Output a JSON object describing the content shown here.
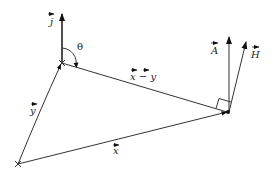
{
  "diagram": {
    "type": "vector-geometry",
    "points": {
      "top_vertex": [
        62,
        63
      ],
      "right_vertex": [
        228,
        112
      ],
      "bottom_left_vertex": [
        18,
        164
      ],
      "j_tip": [
        62,
        12
      ],
      "A_tip": [
        229,
        35
      ],
      "H_tip": [
        246,
        40
      ]
    },
    "labels": {
      "j": "j",
      "theta": "θ",
      "x_minus_y": "x − y",
      "A": "A",
      "H": "H",
      "y": "y",
      "x": "x"
    },
    "colors": {
      "stroke": "#333333",
      "background": "#ffffff"
    }
  }
}
